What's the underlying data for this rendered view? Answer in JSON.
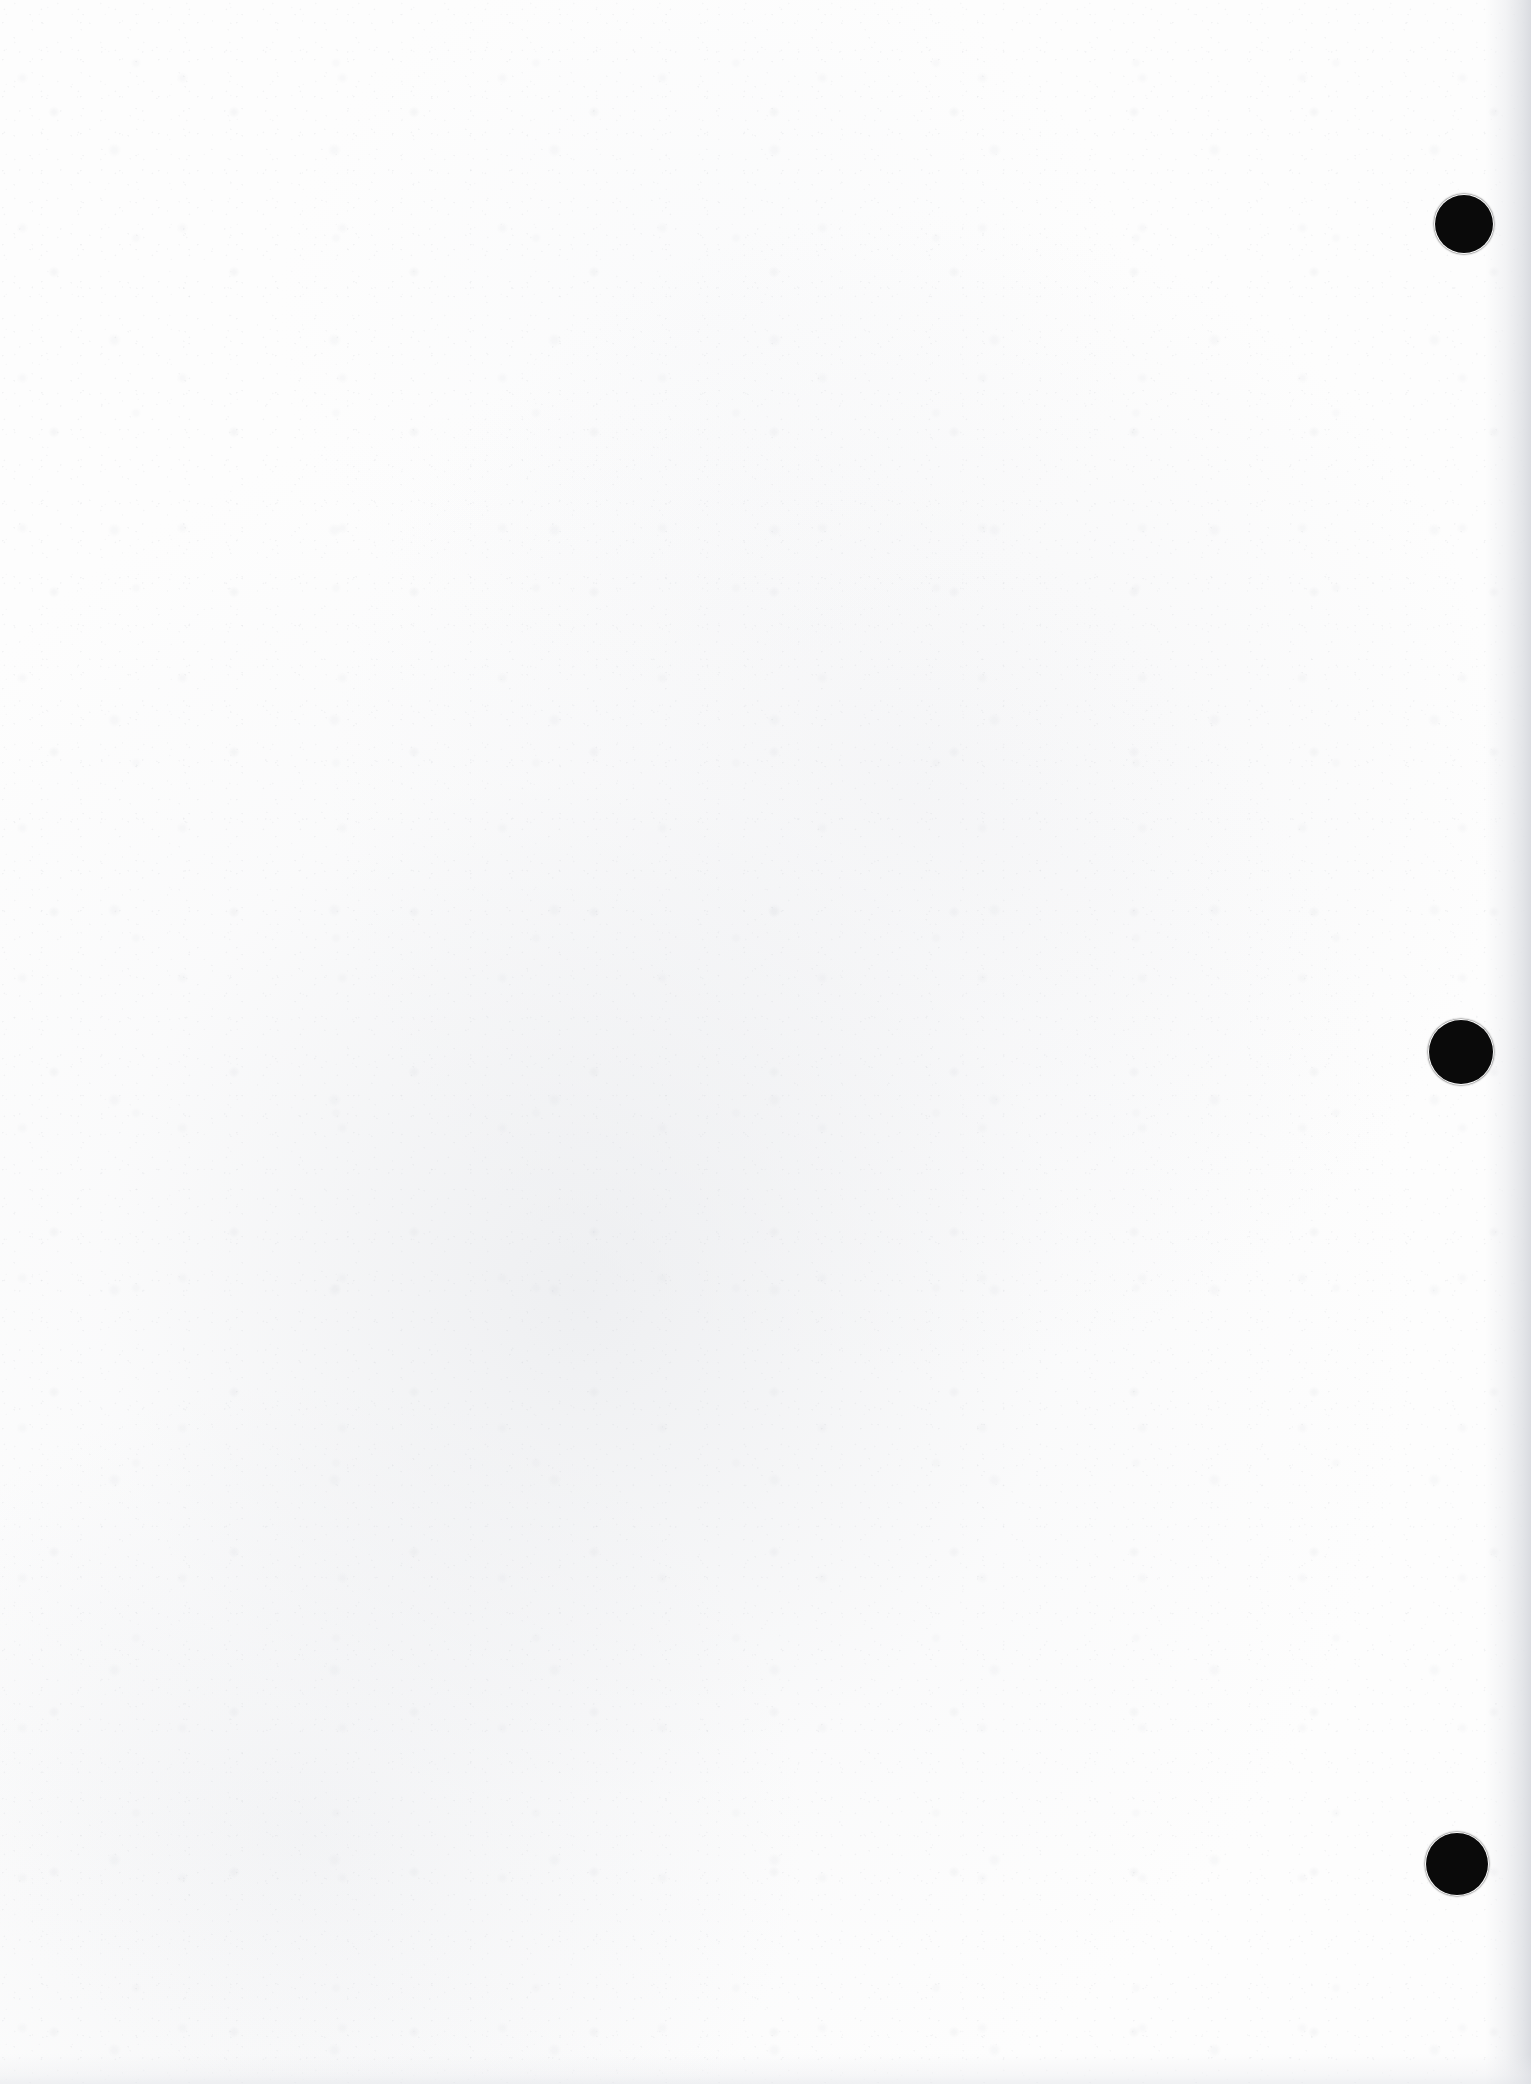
{
  "document": {
    "page_type": "blank-scanned-page",
    "page_content_text": "",
    "orientation": "portrait",
    "page_width_px": 1531,
    "page_height_px": 2084,
    "background_color": "#fdfdfd",
    "ink_color": "#0a0a0a",
    "edge_shade_color": "#dbdde1",
    "description": "Blank scanned sheet of paper with three black binding punch holes along the right edge"
  },
  "punch_holes": {
    "count": 3,
    "color": "#0a0a0a",
    "edge": "right",
    "items": [
      {
        "label": "top punch hole",
        "cx": 1464,
        "cy": 224,
        "diameter": 58
      },
      {
        "label": "middle punch hole",
        "cx": 1461,
        "cy": 1052,
        "diameter": 64
      },
      {
        "label": "bottom punch hole",
        "cx": 1457,
        "cy": 1864,
        "diameter": 62
      }
    ]
  }
}
